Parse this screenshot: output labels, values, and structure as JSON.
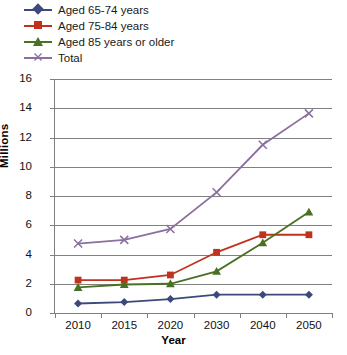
{
  "chart_data": {
    "type": "line",
    "title": "",
    "xlabel": "Year",
    "ylabel": "Millions",
    "categories": [
      "2010",
      "2015",
      "2020",
      "2030",
      "2040",
      "2050"
    ],
    "ylim": [
      0,
      16
    ],
    "yticks": [
      0,
      2,
      4,
      6,
      8,
      10,
      12,
      14,
      16
    ],
    "grid": true,
    "legend_position": "top-left",
    "series": [
      {
        "name": "Aged 65-74 years",
        "color": "#3b4a7a",
        "marker": "diamond",
        "values": [
          0.65,
          0.75,
          0.95,
          1.25,
          1.25,
          1.25
        ]
      },
      {
        "name": "Aged 75-84 years",
        "color": "#c0321c",
        "marker": "square",
        "values": [
          2.25,
          2.25,
          2.6,
          4.15,
          5.35,
          5.35
        ]
      },
      {
        "name": "Aged 85 years or older",
        "color": "#4a7024",
        "marker": "triangle",
        "values": [
          1.75,
          1.95,
          2.0,
          2.85,
          4.8,
          6.9
        ]
      },
      {
        "name": "Total",
        "color": "#8a6fa0",
        "marker": "x",
        "values": [
          4.75,
          5.0,
          5.75,
          8.25,
          11.5,
          13.65
        ]
      }
    ]
  }
}
